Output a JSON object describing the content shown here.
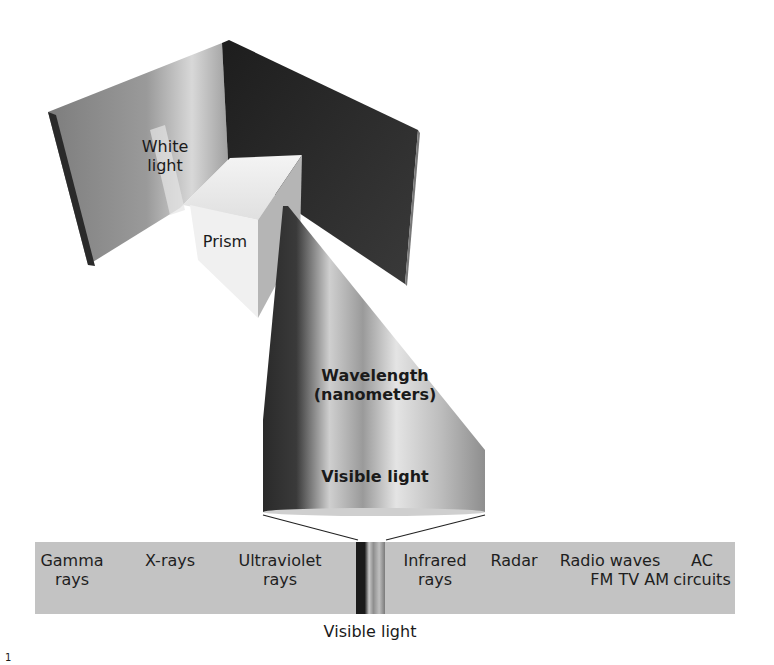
{
  "diagram": {
    "labels": {
      "white_light": [
        "White",
        "light"
      ],
      "prism": "Prism",
      "wavelength": [
        "Wavelength",
        "(nanometers)"
      ],
      "visible_light_cone": "Visible light",
      "visible_light_below": "Visible light"
    },
    "spectrum_band": [
      {
        "id": "gamma",
        "lines": [
          "Gamma",
          "rays"
        ]
      },
      {
        "id": "xrays",
        "lines": [
          "X-rays"
        ]
      },
      {
        "id": "ultraviolet",
        "lines": [
          "Ultraviolet",
          "rays"
        ]
      },
      {
        "id": "infrared",
        "lines": [
          "Infrared",
          "rays"
        ]
      },
      {
        "id": "radar",
        "lines": [
          "Radar"
        ]
      },
      {
        "id": "radio",
        "lines": [
          "Radio waves",
          "FM TV AM"
        ]
      },
      {
        "id": "ac",
        "lines": [
          "AC",
          "circuits"
        ]
      }
    ],
    "page_number": "1",
    "colors": {
      "band": "#c3c3c3",
      "left_panel": "#8a8a8a",
      "right_panel": "#2e2e2e",
      "cone_dark": "#333333",
      "cone_light": "#e0e0e0"
    }
  }
}
